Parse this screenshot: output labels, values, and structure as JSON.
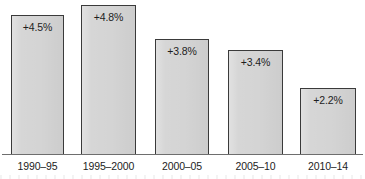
{
  "chart_data": {
    "type": "bar",
    "title": "",
    "subtitle": "",
    "xlabel": "",
    "ylabel": "",
    "categories": [
      "1990–95",
      "1995–2000",
      "2000–05",
      "2005–10",
      "2010–14"
    ],
    "values": [
      4.5,
      4.8,
      3.8,
      3.4,
      2.2
    ],
    "value_labels": [
      "+4.5%",
      "+4.8%",
      "+3.8%",
      "+3.4%",
      "+2.2%"
    ],
    "ylim": [
      0,
      5.0
    ],
    "grid": false,
    "legend": null,
    "annotations": [],
    "series": [
      {
        "name": "",
        "values": [
          4.5,
          4.8,
          3.8,
          3.4,
          2.2
        ]
      }
    ],
    "style": {
      "bar_fill": "#d4d4d4",
      "bar_border": "#3a3a3a",
      "axis_color": "#6e6e6e",
      "background": "#ffffff",
      "text_color": "#1d1d1d",
      "value_label_position": "inside-top"
    },
    "bar_geometry": [
      {
        "x": 11,
        "width": 53,
        "top": 15,
        "height": 140
      },
      {
        "x": 81,
        "width": 55,
        "top": 5,
        "height": 150
      },
      {
        "x": 155,
        "width": 54,
        "top": 39,
        "height": 116
      },
      {
        "x": 228,
        "width": 55,
        "top": 50,
        "height": 105
      },
      {
        "x": 300,
        "width": 56,
        "top": 88,
        "height": 67
      }
    ],
    "label_geometry": [
      {
        "x": 11,
        "width": 53
      },
      {
        "x": 77,
        "width": 63
      },
      {
        "x": 155,
        "width": 54
      },
      {
        "x": 228,
        "width": 55
      },
      {
        "x": 300,
        "width": 56
      }
    ]
  }
}
